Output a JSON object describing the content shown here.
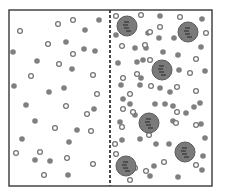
{
  "diagram": {
    "title": "",
    "container": {
      "x": 9,
      "y": 10,
      "width": 203,
      "height": 176,
      "stroke": "#444444",
      "stroke_width": 1.5
    },
    "divider": {
      "x": 110,
      "y1": 10,
      "y2": 186,
      "stroke": "#444444",
      "dash": "3,2"
    },
    "colors": {
      "solute_fill": "#808080",
      "solvent_stroke": "#777777",
      "solvent_fill": "#ffffff",
      "macromolecule_fill": "#7a7a7a",
      "macromolecule_stroke": "#5a5a5a",
      "macromolecule_mark": "#2e2e2e"
    },
    "left_compartment": {
      "solutes": [
        [
          99,
          20
        ],
        [
          85,
          30
        ],
        [
          66,
          42
        ],
        [
          95,
          51
        ],
        [
          37,
          61
        ],
        [
          72,
          69
        ],
        [
          13,
          52
        ],
        [
          14,
          86
        ],
        [
          64,
          88
        ],
        [
          49,
          92
        ],
        [
          26,
          105
        ],
        [
          35,
          160
        ],
        [
          22,
          139
        ],
        [
          50,
          161
        ],
        [
          77,
          130
        ],
        [
          69,
          142
        ],
        [
          68,
          175
        ],
        [
          35,
          121
        ],
        [
          94,
          109
        ],
        [
          84,
          49
        ]
      ],
      "solvents": [
        [
          20,
          31
        ],
        [
          58,
          24
        ],
        [
          73,
          20
        ],
        [
          48,
          44
        ],
        [
          73,
          54
        ],
        [
          59,
          64
        ],
        [
          31,
          76
        ],
        [
          93,
          75
        ],
        [
          97,
          94
        ],
        [
          66,
          106
        ],
        [
          55,
          128
        ],
        [
          91,
          131
        ],
        [
          16,
          153
        ],
        [
          40,
          152
        ],
        [
          67,
          158
        ],
        [
          44,
          175
        ],
        [
          93,
          164
        ],
        [
          87,
          114
        ]
      ]
    },
    "right_compartment": {
      "solutes": [
        [
          160,
          16
        ],
        [
          202,
          19
        ],
        [
          116,
          35
        ],
        [
          148,
          33
        ],
        [
          159,
          38
        ],
        [
          174,
          38
        ],
        [
          201,
          47
        ],
        [
          135,
          48
        ],
        [
          146,
          48
        ],
        [
          163,
          52
        ],
        [
          178,
          55
        ],
        [
          118,
          63
        ],
        [
          137,
          62
        ],
        [
          143,
          60
        ],
        [
          141,
          78
        ],
        [
          179,
          70
        ],
        [
          205,
          71
        ],
        [
          121,
          85
        ],
        [
          140,
          85
        ],
        [
          130,
          104
        ],
        [
          155,
          104
        ],
        [
          165,
          104
        ],
        [
          173,
          106
        ],
        [
          194,
          107
        ],
        [
          120,
          122
        ],
        [
          173,
          121
        ],
        [
          186,
          113
        ],
        [
          142,
          125
        ],
        [
          140,
          139
        ],
        [
          156,
          144
        ],
        [
          169,
          144
        ],
        [
          201,
          124
        ],
        [
          205,
          138
        ],
        [
          122,
          140
        ],
        [
          154,
          166
        ],
        [
          202,
          170
        ],
        [
          150,
          176
        ],
        [
          178,
          177
        ],
        [
          203,
          156
        ],
        [
          160,
          88
        ],
        [
          200,
          103
        ],
        [
          170,
          92
        ],
        [
          123,
          99
        ],
        [
          135,
          115
        ]
      ],
      "solvents": [
        [
          116,
          16
        ],
        [
          141,
          15
        ],
        [
          180,
          17
        ],
        [
          160,
          27
        ],
        [
          150,
          32
        ],
        [
          206,
          33
        ],
        [
          122,
          46
        ],
        [
          145,
          45
        ],
        [
          150,
          60
        ],
        [
          196,
          59
        ],
        [
          190,
          73
        ],
        [
          123,
          78
        ],
        [
          137,
          74
        ],
        [
          151,
          86
        ],
        [
          130,
          94
        ],
        [
          177,
          87
        ],
        [
          196,
          91
        ],
        [
          123,
          109
        ],
        [
          133,
          112
        ],
        [
          177,
          112
        ],
        [
          196,
          125
        ],
        [
          122,
          127
        ],
        [
          116,
          154
        ],
        [
          149,
          135
        ],
        [
          164,
          162
        ],
        [
          196,
          165
        ],
        [
          135,
          168
        ],
        [
          146,
          171
        ],
        [
          130,
          180
        ],
        [
          176,
          123
        ],
        [
          115,
          144
        ]
      ],
      "macromolecules": [
        [
          127,
          26
        ],
        [
          188,
          32
        ],
        [
          162,
          70
        ],
        [
          149,
          123
        ],
        [
          185,
          152
        ],
        [
          126,
          166
        ]
      ]
    },
    "sizes": {
      "solute_r": 2.8,
      "solvent_r": 2.4,
      "solvent_stroke_w": 1.3,
      "macro_r": 10
    }
  }
}
